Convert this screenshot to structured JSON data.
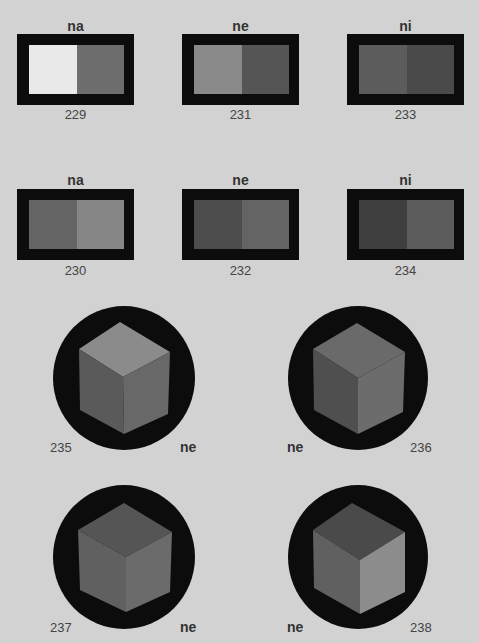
{
  "swatches": [
    {
      "title": "na",
      "number": "229",
      "left_color": "#e9e9e9",
      "right_color": "#6d6d6d"
    },
    {
      "title": "ne",
      "number": "231",
      "left_color": "#8a8a8a",
      "right_color": "#555555"
    },
    {
      "title": "ni",
      "number": "233",
      "left_color": "#5c5c5c",
      "right_color": "#4a4a4a"
    },
    {
      "title": "na",
      "number": "230",
      "left_color": "#646464",
      "right_color": "#868686"
    },
    {
      "title": "ne",
      "number": "232",
      "left_color": "#4d4d4d",
      "right_color": "#646464"
    },
    {
      "title": "ni",
      "number": "234",
      "left_color": "#3f3f3f",
      "right_color": "#5c5c5c"
    }
  ],
  "figures": [
    {
      "number": "235",
      "label": "ne",
      "top_color": "#8b8b8b",
      "left_color": "#5a5a5a",
      "right_color": "#686868"
    },
    {
      "number": "236",
      "label": "ne",
      "top_color": "#6a6a6a",
      "left_color": "#4f4f4f",
      "right_color": "#6c6c6c"
    },
    {
      "number": "237",
      "label": "ne",
      "top_color": "#555555",
      "left_color": "#606060",
      "right_color": "#6b6b6b"
    },
    {
      "number": "238",
      "label": "ne",
      "top_color": "#4a4a4a",
      "left_color": "#606060",
      "right_color": "#8c8c8c"
    }
  ],
  "colors": {
    "background": "#d2d2d2",
    "frame": "#0c0c0c"
  }
}
